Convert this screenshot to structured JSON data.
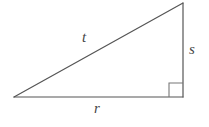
{
  "figure": {
    "kind": "right-triangle-diagram",
    "width": 209,
    "height": 127,
    "background_color": "#ffffff",
    "stroke_color": "#555555",
    "stroke_width": 1.2,
    "label_color": "#454545"
  },
  "vertices": {
    "left": {
      "name": "left-vertex",
      "x": 14,
      "y": 97
    },
    "apex": {
      "name": "top-right-vertex",
      "x": 183,
      "y": 3
    },
    "corner": {
      "name": "right-angle-vertex",
      "x": 183,
      "y": 97
    }
  },
  "sides": [
    {
      "id": "hypotenuse",
      "label": "t",
      "from": "left",
      "to": "apex"
    },
    {
      "id": "vertical-leg",
      "label": "s",
      "from": "apex",
      "to": "corner"
    },
    {
      "id": "horizontal-leg",
      "label": "r",
      "from": "left",
      "to": "corner"
    }
  ],
  "labels": {
    "hypotenuse": "t",
    "vertical_leg": "s",
    "horizontal_leg": "r"
  },
  "right_angle_marker": {
    "name": "right-angle-square",
    "x": 169,
    "y": 83,
    "size": 14,
    "shown": true
  }
}
